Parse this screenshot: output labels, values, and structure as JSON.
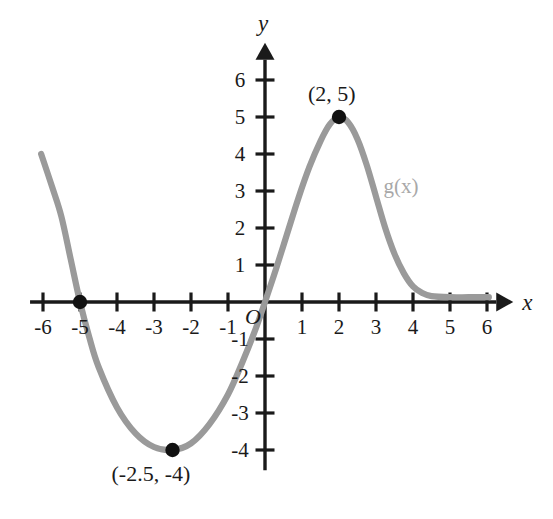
{
  "figure": {
    "background_color": "#ffffff",
    "axis_color": "#1a1a1a",
    "curve_color": "#9a9a9a",
    "point_color": "#111111",
    "origin_label": "O"
  },
  "axes": {
    "x_name": "x",
    "y_name": "y",
    "x_ticks": [
      {
        "value": -6,
        "label": "-6"
      },
      {
        "value": -5,
        "label": "-5"
      },
      {
        "value": -4,
        "label": "-4"
      },
      {
        "value": -3,
        "label": "-3"
      },
      {
        "value": -2,
        "label": "-2"
      },
      {
        "value": -1,
        "label": "-1"
      },
      {
        "value": 1,
        "label": "1"
      },
      {
        "value": 2,
        "label": "2"
      },
      {
        "value": 3,
        "label": "3"
      },
      {
        "value": 4,
        "label": "4"
      },
      {
        "value": 5,
        "label": "5"
      },
      {
        "value": 6,
        "label": "6"
      }
    ],
    "y_ticks": [
      {
        "value": 6,
        "label": "6"
      },
      {
        "value": 5,
        "label": "5"
      },
      {
        "value": 4,
        "label": "4"
      },
      {
        "value": 3,
        "label": "3"
      },
      {
        "value": 2,
        "label": "2"
      },
      {
        "value": 1,
        "label": "1"
      },
      {
        "value": -1,
        "label": "-1"
      },
      {
        "value": -2,
        "label": "-2"
      },
      {
        "value": -3,
        "label": "-3"
      },
      {
        "value": -4,
        "label": "-4"
      }
    ]
  },
  "annotations": {
    "curve_label": "g(x)",
    "max_point_label": "(2, 5)",
    "min_point_label": "(-2.5, -4)"
  },
  "chart_data": {
    "type": "line",
    "title": "",
    "xlabel": "x",
    "ylabel": "y",
    "xlim": [
      -6.5,
      6.6
    ],
    "ylim": [
      -4.6,
      6.6
    ],
    "grid": false,
    "legend": "inline-curve-label",
    "series": [
      {
        "name": "g(x)",
        "color": "#9a9a9a",
        "points": [
          {
            "x": -6.05,
            "y": 4.0
          },
          {
            "x": -5.75,
            "y": 3.1
          },
          {
            "x": -5.5,
            "y": 2.3
          },
          {
            "x": -5.25,
            "y": 1.15
          },
          {
            "x": -5.0,
            "y": 0.0
          },
          {
            "x": -4.75,
            "y": -0.95
          },
          {
            "x": -4.5,
            "y": -1.75
          },
          {
            "x": -4.0,
            "y": -2.85
          },
          {
            "x": -3.5,
            "y": -3.55
          },
          {
            "x": -3.0,
            "y": -3.92
          },
          {
            "x": -2.5,
            "y": -4.0
          },
          {
            "x": -2.0,
            "y": -3.82
          },
          {
            "x": -1.5,
            "y": -3.3
          },
          {
            "x": -1.0,
            "y": -2.5
          },
          {
            "x": -0.6,
            "y": -1.6
          },
          {
            "x": -0.25,
            "y": -0.72
          },
          {
            "x": 0.0,
            "y": 0.0
          },
          {
            "x": 0.3,
            "y": 0.9
          },
          {
            "x": 0.6,
            "y": 1.85
          },
          {
            "x": 0.9,
            "y": 2.8
          },
          {
            "x": 1.2,
            "y": 3.65
          },
          {
            "x": 1.5,
            "y": 4.35
          },
          {
            "x": 1.75,
            "y": 4.8
          },
          {
            "x": 2.0,
            "y": 5.0
          },
          {
            "x": 2.25,
            "y": 4.85
          },
          {
            "x": 2.5,
            "y": 4.4
          },
          {
            "x": 2.75,
            "y": 3.7
          },
          {
            "x": 3.0,
            "y": 2.85
          },
          {
            "x": 3.25,
            "y": 2.0
          },
          {
            "x": 3.5,
            "y": 1.3
          },
          {
            "x": 3.75,
            "y": 0.78
          },
          {
            "x": 4.0,
            "y": 0.42
          },
          {
            "x": 4.25,
            "y": 0.24
          },
          {
            "x": 4.5,
            "y": 0.16
          },
          {
            "x": 5.0,
            "y": 0.13
          },
          {
            "x": 5.5,
            "y": 0.13
          },
          {
            "x": 6.05,
            "y": 0.13
          }
        ]
      }
    ],
    "marked_points": [
      {
        "x": 2,
        "y": 5,
        "label": "(2, 5)",
        "kind": "maximum"
      },
      {
        "x": -2.5,
        "y": -4,
        "label": "(-2.5, -4)",
        "kind": "minimum"
      },
      {
        "x": -5,
        "y": 0,
        "label": "",
        "kind": "x-intercept"
      }
    ]
  }
}
